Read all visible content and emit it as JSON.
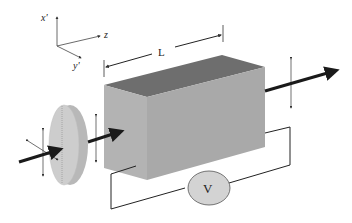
{
  "diagram": {
    "axes": {
      "x_label": "x'",
      "y_label": "y'",
      "z_label": "z"
    },
    "length_label": "L",
    "voltmeter_label": "V",
    "colors": {
      "box_top": "#6e6e6e",
      "box_front": "#a9a9a9",
      "box_side": "#b8b8b8",
      "disk": "#c8c8c8",
      "disk_edge": "#b4b4b4",
      "voltmeter_fill": "#d3d3d3",
      "arrow": "#1a1a1a",
      "line": "#333333"
    }
  }
}
